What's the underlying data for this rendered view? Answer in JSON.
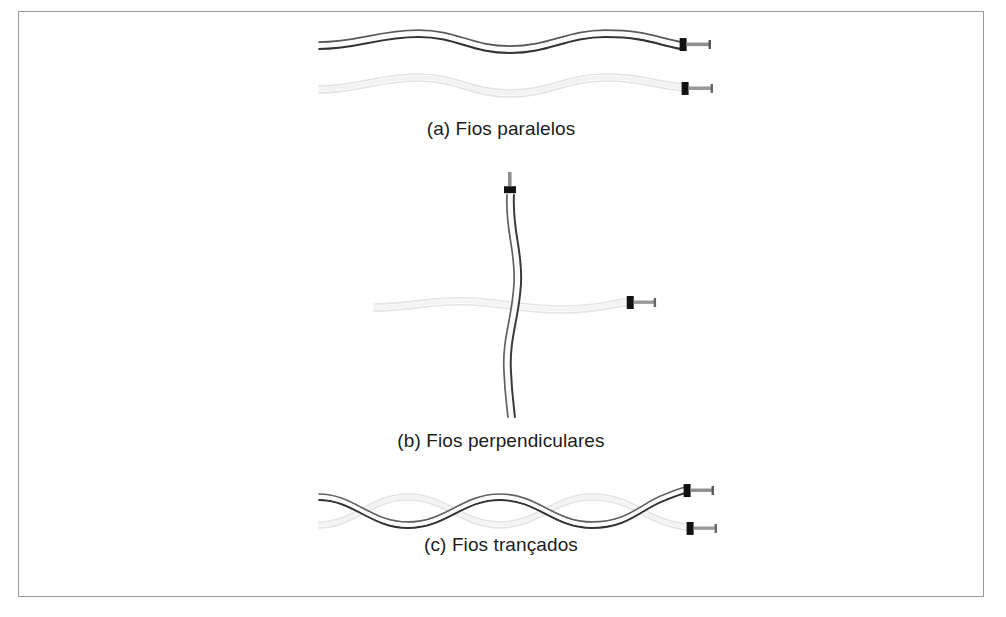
{
  "figure": {
    "background_color": "#ffffff",
    "frame_color": "#9a9a9a",
    "wire_dark_color": "#3a3a3a",
    "wire_light_color": "#dcdcdc",
    "terminal_color": "#1a1a1a",
    "lead_color": "#8c8c8c",
    "caption_color": "#1c1c1c"
  },
  "panels": [
    {
      "id": "a",
      "caption": "(a) Fios paralelos",
      "description": "two wavy wires running side by side, each ending in a terminal at the right",
      "wires": [
        {
          "name": "conductor-dark",
          "style": "dark",
          "terminal": "right"
        },
        {
          "name": "conductor-light",
          "style": "light",
          "terminal": "right"
        }
      ]
    },
    {
      "id": "b",
      "caption": "(b) Fios perpendiculares",
      "description": "a vertical wavy wire crossing a faint horizontal wavy wire at right angles",
      "wires": [
        {
          "name": "conductor-dark-vertical",
          "style": "dark",
          "terminal": "top"
        },
        {
          "name": "conductor-light-horizontal",
          "style": "light",
          "terminal": "right"
        }
      ]
    },
    {
      "id": "c",
      "caption": "(c) Fios trançados",
      "description": "two wires twisted around each other in a braid, separating into two terminals at the right",
      "wires": [
        {
          "name": "conductor-dark-twisted",
          "style": "dark",
          "terminal": "right"
        },
        {
          "name": "conductor-light-twisted",
          "style": "light",
          "terminal": "right"
        }
      ]
    }
  ]
}
